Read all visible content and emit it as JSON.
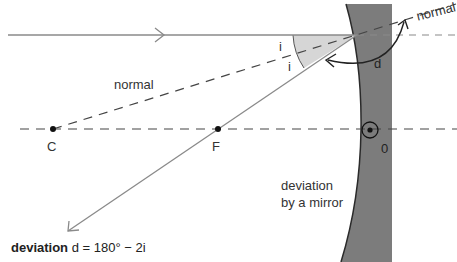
{
  "figure": {
    "labels": {
      "normal_left": "normal",
      "normal_right": "normal",
      "angle_incidence": "i",
      "angle_reflection": "i",
      "deviation_symbol": "d",
      "center_of_curvature": "C",
      "focal_point": "F",
      "pole": "0",
      "mirror_caption_line1": "deviation",
      "mirror_caption_line2": "by a mirror"
    },
    "formula": {
      "term": "deviation",
      "expression": "d = 180° − 2i"
    },
    "colors": {
      "mirror_fill": "#7a7a7a",
      "ray": "#8a8a8a",
      "dashed": "#444444",
      "angle_shade": "#d9d9d9",
      "text": "#333333"
    }
  }
}
